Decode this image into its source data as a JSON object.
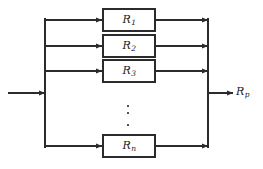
{
  "diagram": {
    "type": "reliability-block-diagram",
    "background_color": "#ffffff",
    "stroke_color": "#2b2b2b",
    "box_fill": "#ffffff",
    "blocks": [
      {
        "id": "R1",
        "symbol": "R",
        "subscript": "1",
        "x": 103,
        "y": 9,
        "width": 52,
        "height": 22
      },
      {
        "id": "R2",
        "symbol": "R",
        "subscript": "2",
        "x": 103,
        "y": 35,
        "width": 52,
        "height": 22
      },
      {
        "id": "R3",
        "symbol": "R",
        "subscript": "3",
        "x": 103,
        "y": 60,
        "width": 52,
        "height": 22
      },
      {
        "id": "Rn",
        "symbol": "R",
        "subscript": "n",
        "x": 103,
        "y": 135,
        "width": 52,
        "height": 22
      }
    ],
    "input": {
      "label": "",
      "arrow_y": 93,
      "arrow_x_start": 8,
      "arrow_x_end": 45
    },
    "output": {
      "symbol": "R",
      "subscript": "p",
      "arrow_y": 93,
      "arrow_x_start": 208,
      "arrow_x_end": 233
    },
    "left_bus": {
      "x": 45,
      "y_top": 18,
      "y_bottom": 148
    },
    "right_bus": {
      "x": 208,
      "y_top": 18,
      "y_bottom": 148
    },
    "ellipsis": {
      "x": 127,
      "dots_y": [
        105,
        112,
        124
      ],
      "count": 3
    }
  }
}
